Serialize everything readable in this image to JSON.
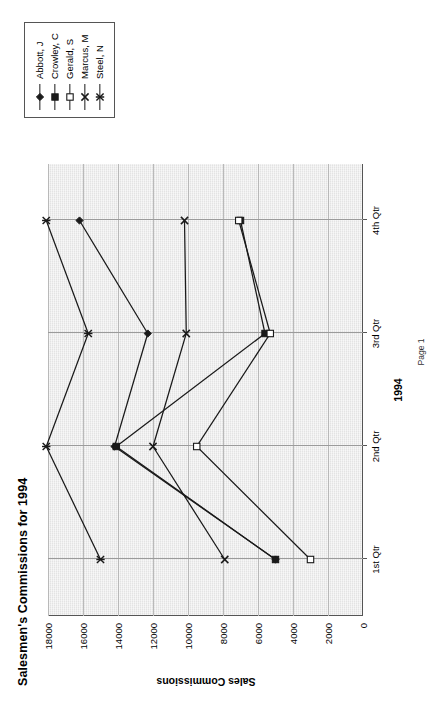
{
  "document": {
    "title": "Salesmen's Commissions for 1994",
    "footer": "Page 1"
  },
  "chart_data": {
    "type": "line",
    "title": "Salesmen's Commissions for 1994",
    "xlabel": "1994",
    "ylabel": "Sales Commissions",
    "categories": [
      "1st Qtr",
      "2nd Qtr",
      "3rd Qtr",
      "4th Qtr"
    ],
    "ylim": [
      0,
      18000
    ],
    "yticks": [
      0,
      2000,
      4000,
      6000,
      8000,
      10000,
      12000,
      14000,
      16000,
      18000
    ],
    "ytick_labels": [
      "0",
      "2000",
      "4000",
      "6000",
      "8000",
      "10000",
      "12000",
      "14000",
      "16000",
      "18000"
    ],
    "grid": true,
    "grid_axis": "x",
    "legend_position": "right",
    "plot_background": "#e3e3e3",
    "line_color": "#1a1a1a",
    "series": [
      {
        "name": "Abbott, J",
        "marker": "filled-diamond",
        "values": [
          5000,
          14200,
          12300,
          16200
        ]
      },
      {
        "name": "Crowley, C",
        "marker": "filled-square",
        "values": [
          5000,
          14100,
          5600,
          7000
        ]
      },
      {
        "name": "Gerald, S",
        "marker": "open-square",
        "values": [
          3000,
          9500,
          5300,
          7100
        ]
      },
      {
        "name": "Marcus, M",
        "marker": "cross-x",
        "values": [
          7900,
          12000,
          10100,
          10200
        ]
      },
      {
        "name": "Steel, N",
        "marker": "asterisk",
        "values": [
          15000,
          18100,
          15700,
          18100
        ]
      }
    ]
  },
  "legend": {
    "entries": [
      {
        "label": "Abbott, J",
        "marker": "filled-diamond"
      },
      {
        "label": "Crowley, C",
        "marker": "filled-square"
      },
      {
        "label": "Gerald, S",
        "marker": "open-square"
      },
      {
        "label": "Marcus, M",
        "marker": "cross-x"
      },
      {
        "label": "Steel, N",
        "marker": "asterisk"
      }
    ]
  }
}
